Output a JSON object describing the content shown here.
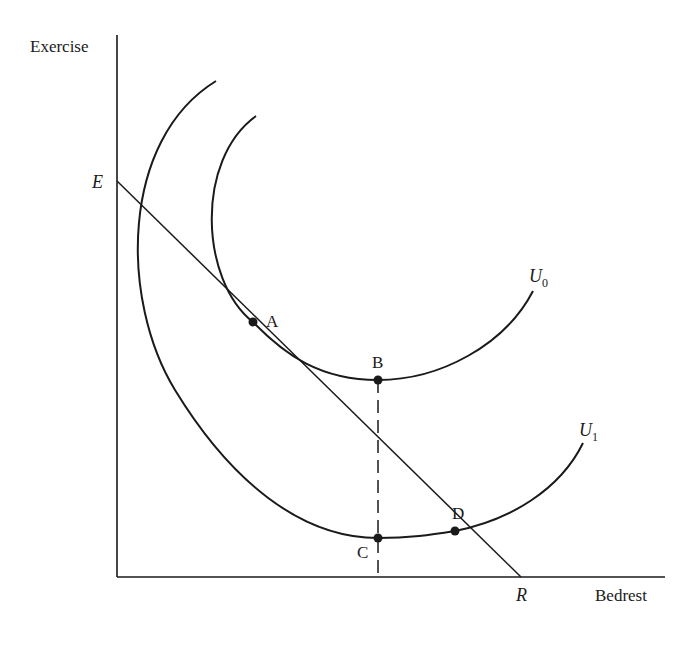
{
  "axes": {
    "y_label": "Exercise",
    "x_label": "Bedrest"
  },
  "budget_line": {
    "y_intercept_label": "E",
    "x_intercept_label": "R"
  },
  "curves": [
    {
      "name": "U",
      "subscript": "0"
    },
    {
      "name": "U",
      "subscript": "1"
    }
  ],
  "points": [
    {
      "label": "A"
    },
    {
      "label": "B"
    },
    {
      "label": "C"
    },
    {
      "label": "D"
    }
  ],
  "colors": {
    "ink": "#1a1a1a",
    "background": "#ffffff"
  }
}
